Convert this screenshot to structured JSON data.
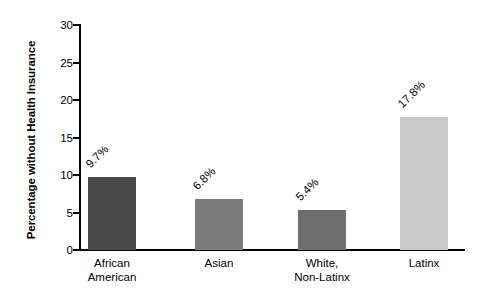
{
  "chart_data": {
    "type": "bar",
    "title": "",
    "subtitle": "",
    "xlabel": "",
    "ylabel": "Percentage without Health Insurance",
    "categories": [
      "African American",
      "Asian",
      "White, Non-Latinx",
      "Latinx"
    ],
    "values": [
      9.7,
      6.8,
      5.4,
      17.8
    ],
    "data_labels": [
      "9.7%",
      "6.8%",
      "5.4%",
      "17.8%"
    ],
    "bar_colors": [
      "#4a4a4a",
      "#7b7b7b",
      "#6e6e6e",
      "#c9c9c9"
    ],
    "ylim": [
      0,
      30
    ],
    "ytick_values": [
      0,
      5,
      10,
      15,
      20,
      25,
      30
    ],
    "ytick_labels": [
      "0",
      "5",
      "10",
      "15",
      "20",
      "25",
      "30"
    ],
    "grid": false,
    "legend": "none",
    "axis_color": "#000000",
    "background_color": "#ffffff"
  },
  "axis": {
    "y_title": "Percentage without Health Insurance"
  },
  "bars": [
    {
      "category_line1": "African",
      "category_line2": "American",
      "label": "9.7%",
      "value": 9.7,
      "color": "#4a4a4a"
    },
    {
      "category_line1": "Asian",
      "category_line2": "",
      "label": "6.8%",
      "value": 6.8,
      "color": "#7b7b7b"
    },
    {
      "category_line1": "White,",
      "category_line2": "Non-Latinx",
      "label": "5.4%",
      "value": 5.4,
      "color": "#6e6e6e"
    },
    {
      "category_line1": "Latinx",
      "category_line2": "",
      "label": "17.8%",
      "value": 17.8,
      "color": "#c9c9c9"
    }
  ],
  "yticks": [
    {
      "label": "30",
      "value": 30
    },
    {
      "label": "25",
      "value": 25
    },
    {
      "label": "20",
      "value": 20
    },
    {
      "label": "15",
      "value": 15
    },
    {
      "label": "10",
      "value": 10
    },
    {
      "label": "5",
      "value": 5
    },
    {
      "label": "0",
      "value": 0
    }
  ]
}
